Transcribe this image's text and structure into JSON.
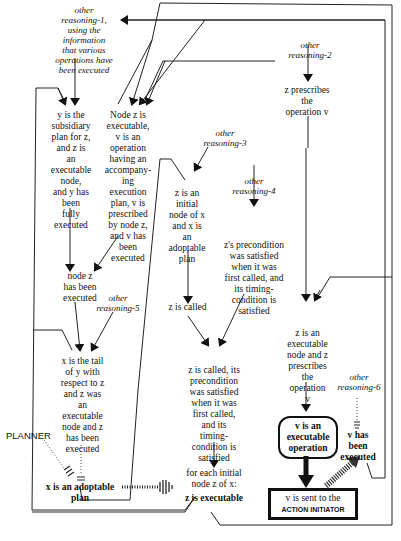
{
  "diagram": {
    "type": "reasoning-flow",
    "nodes": {
      "other_reasoning_1": "other reasoning-1, using the information that various operations have been executed",
      "other_reasoning_2": "other reasoning-2",
      "z_prescribes_v": "z prescribes the operation v",
      "y_subsidiary": "y is the subsidiary plan for z, and z is an executable node, and y has been fully executed",
      "node_z_executable": "Node z is executable, v is an operation having an accompany-ing execution plan, v is prescribed by node z, and v has been executed",
      "other_reasoning_3": "other reasoning-3",
      "z_initial_node": "z is an initial node of x and x is an adoptable plan",
      "other_reasoning_4": "other reasoning-4",
      "z_precondition": "z's precondition was satisfied when it was first called, and its timing-condition is satisfied",
      "node_z_executed": "node z has been executed",
      "other_reasoning_5": "other reasoning-5",
      "z_is_called": "z is called",
      "x_tail_of_y": "x is the tail of y with respect to z and z was an executable node and z has been executed",
      "z_called_precondition": "z is called, its precondition was satisfied when it was first called, and its timing-condition is satisfied",
      "z_executable_prescribes": "z is an executable node and z prescribes the operation v",
      "other_reasoning_6": "other reasoning-6",
      "v_executable_operation": "v is an executable operation",
      "v_has_been_executed": "v has been executed",
      "planner": "PLANNER",
      "x_adoptable_plan": "x is an adoptable plan",
      "for_each_initial": "for each initial node z of x:",
      "z_is_executable": "z is executable",
      "v_sent_line1": "v is sent to the",
      "v_sent_line2": "ACTION INITIATOR"
    },
    "lines": {
      "reason1": [
        "other",
        "reasoning-1,",
        "using the",
        "information",
        "that various",
        "operations have",
        "been executed"
      ],
      "reason2": [
        "other",
        "reasoning-2"
      ],
      "zpresc": [
        "z prescribes",
        "the",
        "operation v"
      ],
      "ysub": [
        "y is the",
        "subsidiary",
        "plan for z,",
        "and z is",
        "an",
        "executable",
        "node,",
        "and y has",
        "been",
        "fully",
        "executed"
      ],
      "nodez": [
        "Node z is",
        "executable,",
        "v is an",
        "operation",
        "having an",
        "accompany-",
        "ing",
        "execution",
        "plan,  v is",
        "prescribed",
        "by node z,",
        "and v has",
        "been",
        "executed"
      ],
      "reason3": [
        "other",
        "reasoning-3"
      ],
      "zinit": [
        "z is an",
        "initial",
        "node of x",
        "and x is",
        "an",
        "adoptable",
        "plan"
      ],
      "reason4": [
        "other",
        "reasoning-4"
      ],
      "zprecond": [
        "z's precondition",
        "was satisfied",
        "when it was",
        "first called, and",
        "its timing-",
        "condition is",
        "satisfied"
      ],
      "nodezexec": [
        "node z",
        "has been",
        "executed"
      ],
      "reason5": [
        "other",
        "reasoning-5"
      ],
      "zcalled": [
        "z is called"
      ],
      "xtail": [
        "x is the tail",
        "of y with",
        "respect to z",
        "and z was",
        "an",
        "executable",
        "node and z",
        "has been",
        "executed"
      ],
      "zcalledprec": [
        "z is called, its",
        "precondition",
        "was satisfied",
        "when it was",
        "first called,",
        "and its",
        "timing-",
        "condition is",
        "satisfied"
      ],
      "zexecpresc": [
        "z is an",
        "executable",
        "node and z",
        "prescribes",
        "the",
        "operation",
        "v"
      ],
      "reason6": [
        "other",
        "reasoning-6"
      ],
      "vexecop": [
        "v is an",
        "executable",
        "operation"
      ],
      "vhasbeen": [
        "v has",
        "been",
        "executed"
      ],
      "xadopt": [
        "x is an adoptable",
        "plan"
      ],
      "foreach": [
        "for each initial",
        "node z of x:"
      ]
    },
    "caption": "Figure ..."
  }
}
